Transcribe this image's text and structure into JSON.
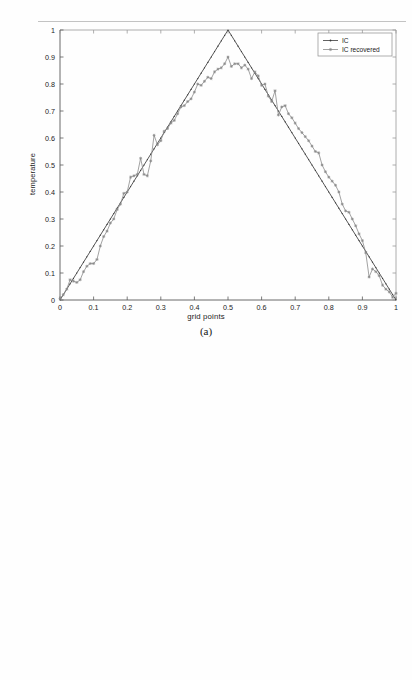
{
  "page": {
    "background": "#fefefe",
    "artifact_line": "scan-artifact-line"
  },
  "figures": [
    {
      "id": "figure-a",
      "caption": "(a)",
      "xlabel": "grid points",
      "ylabel": "temperature",
      "legend": {
        "position": "top-right",
        "entries": [
          {
            "label": "IC",
            "marker": "dot",
            "line": "solid",
            "color": "#3a3a3a"
          },
          {
            "label": "IC recovered",
            "marker": "star",
            "line": "solid",
            "color": "#8a8a8a"
          }
        ]
      }
    },
    {
      "id": "figure-b",
      "caption": "(b)",
      "xlabel": "grid points",
      "ylabel": "temperature",
      "legend": {
        "position": "top-right",
        "entries": [
          {
            "label": "IC",
            "marker": "dot",
            "line": "solid",
            "color": "#3a3a3a"
          },
          {
            "label": "IC recovered",
            "marker": "star",
            "line": "none",
            "color": "#8a8a8a"
          }
        ]
      }
    }
  ],
  "chart_data": [
    {
      "type": "line",
      "id": "figure-a",
      "title": "",
      "xlabel": "grid points",
      "ylabel": "temperature",
      "xlim": [
        0,
        1
      ],
      "ylim": [
        0,
        1
      ],
      "xticks": [
        "0",
        "0.1",
        "0.2",
        "0.3",
        "0.4",
        "0.5",
        "0.6",
        "0.7",
        "0.8",
        "0.9",
        "1"
      ],
      "yticks": [
        "0",
        "0.1",
        "0.2",
        "0.3",
        "0.4",
        "0.5",
        "0.6",
        "0.7",
        "0.8",
        "0.9",
        "1"
      ],
      "grid": false,
      "legend_position": "upper right",
      "series": [
        {
          "name": "IC",
          "style": "solid-line-with-small-dots",
          "color": "#3a3a3a",
          "x": [
            0,
            0.05,
            0.1,
            0.15,
            0.2,
            0.25,
            0.3,
            0.35,
            0.4,
            0.45,
            0.5,
            0.55,
            0.6,
            0.65,
            0.7,
            0.75,
            0.8,
            0.85,
            0.9,
            0.95,
            1
          ],
          "values": [
            0,
            0.1,
            0.2,
            0.3,
            0.4,
            0.5,
            0.6,
            0.7,
            0.8,
            0.9,
            1.0,
            0.9,
            0.8,
            0.7,
            0.6,
            0.5,
            0.4,
            0.3,
            0.2,
            0.1,
            0
          ]
        },
        {
          "name": "IC recovered",
          "style": "noisy-line-with-star-markers",
          "color": "#8a8a8a",
          "x": [
            0.0,
            0.01,
            0.02,
            0.03,
            0.04,
            0.05,
            0.06,
            0.07,
            0.08,
            0.09,
            0.1,
            0.11,
            0.12,
            0.13,
            0.14,
            0.15,
            0.16,
            0.17,
            0.18,
            0.19,
            0.2,
            0.21,
            0.22,
            0.23,
            0.24,
            0.25,
            0.26,
            0.27,
            0.28,
            0.29,
            0.3,
            0.31,
            0.32,
            0.33,
            0.34,
            0.35,
            0.36,
            0.37,
            0.38,
            0.39,
            0.4,
            0.41,
            0.42,
            0.43,
            0.44,
            0.45,
            0.46,
            0.47,
            0.48,
            0.49,
            0.5,
            0.51,
            0.52,
            0.53,
            0.54,
            0.55,
            0.56,
            0.57,
            0.58,
            0.59,
            0.6,
            0.61,
            0.62,
            0.63,
            0.64,
            0.65,
            0.66,
            0.67,
            0.68,
            0.69,
            0.7,
            0.71,
            0.72,
            0.73,
            0.74,
            0.75,
            0.76,
            0.77,
            0.78,
            0.79,
            0.8,
            0.81,
            0.82,
            0.83,
            0.84,
            0.85,
            0.86,
            0.87,
            0.88,
            0.89,
            0.9,
            0.91,
            0.92,
            0.93,
            0.94,
            0.95,
            0.96,
            0.97,
            0.98,
            0.99,
            1.0
          ],
          "values": [
            0.005,
            0.02,
            0.04,
            0.075,
            0.07,
            0.065,
            0.075,
            0.105,
            0.125,
            0.135,
            0.135,
            0.15,
            0.2,
            0.235,
            0.255,
            0.285,
            0.3,
            0.335,
            0.355,
            0.395,
            0.4,
            0.455,
            0.46,
            0.465,
            0.525,
            0.465,
            0.46,
            0.515,
            0.61,
            0.575,
            0.59,
            0.625,
            0.635,
            0.655,
            0.665,
            0.69,
            0.715,
            0.72,
            0.735,
            0.745,
            0.77,
            0.8,
            0.795,
            0.81,
            0.825,
            0.82,
            0.845,
            0.855,
            0.86,
            0.875,
            0.9,
            0.865,
            0.875,
            0.875,
            0.86,
            0.87,
            0.855,
            0.82,
            0.845,
            0.83,
            0.795,
            0.8,
            0.755,
            0.735,
            0.775,
            0.685,
            0.715,
            0.72,
            0.69,
            0.675,
            0.655,
            0.635,
            0.62,
            0.605,
            0.59,
            0.57,
            0.55,
            0.545,
            0.5,
            0.475,
            0.455,
            0.44,
            0.425,
            0.4,
            0.355,
            0.33,
            0.325,
            0.3,
            0.275,
            0.245,
            0.22,
            0.175,
            0.085,
            0.115,
            0.105,
            0.09,
            0.055,
            0.04,
            0.03,
            0.01,
            0.025
          ]
        }
      ]
    },
    {
      "type": "scatter",
      "id": "figure-b",
      "title": "",
      "xlabel": "grid points",
      "ylabel": "temperature",
      "xlim": [
        0,
        1
      ],
      "ylim": [
        0,
        1
      ],
      "xticks": [
        "0",
        "0.1",
        "0.2",
        "0.3",
        "0.4",
        "0.5",
        "0.6",
        "0.7",
        "0.8",
        "0.9",
        "1"
      ],
      "yticks": [
        "0",
        "0.1",
        "0.2",
        "0.3",
        "0.4",
        "0.5",
        "0.6",
        "0.7",
        "0.8",
        "0.9",
        "1"
      ],
      "grid": false,
      "legend_position": "upper right",
      "series": [
        {
          "name": "IC",
          "style": "dotted-triangle",
          "color": "#3a3a3a",
          "x": [
            0,
            0.05,
            0.1,
            0.15,
            0.2,
            0.25,
            0.3,
            0.35,
            0.4,
            0.45,
            0.5,
            0.55,
            0.6,
            0.65,
            0.7,
            0.75,
            0.8,
            0.85,
            0.9,
            0.95,
            1
          ],
          "values": [
            0,
            0.1,
            0.2,
            0.3,
            0.4,
            0.5,
            0.6,
            0.7,
            0.8,
            0.9,
            1.0,
            0.9,
            0.8,
            0.7,
            0.6,
            0.5,
            0.4,
            0.3,
            0.2,
            0.1,
            0
          ]
        },
        {
          "name": "IC recovered",
          "style": "star-markers-smooth",
          "color": "#8a8a8a",
          "x": [
            0.0,
            0.01,
            0.02,
            0.03,
            0.04,
            0.05,
            0.06,
            0.07,
            0.08,
            0.09,
            0.1,
            0.11,
            0.12,
            0.13,
            0.14,
            0.15,
            0.16,
            0.17,
            0.18,
            0.19,
            0.2,
            0.21,
            0.22,
            0.23,
            0.24,
            0.25,
            0.26,
            0.27,
            0.28,
            0.29,
            0.3,
            0.31,
            0.32,
            0.33,
            0.34,
            0.35,
            0.36,
            0.37,
            0.38,
            0.39,
            0.4,
            0.41,
            0.42,
            0.43,
            0.44,
            0.45,
            0.46,
            0.47,
            0.48,
            0.49,
            0.5,
            0.51,
            0.52,
            0.53,
            0.54,
            0.55,
            0.56,
            0.57,
            0.58,
            0.59,
            0.6,
            0.61,
            0.62,
            0.63,
            0.64,
            0.65,
            0.66,
            0.67,
            0.68,
            0.69,
            0.7,
            0.71,
            0.72,
            0.73,
            0.74,
            0.75,
            0.76,
            0.77,
            0.78,
            0.79,
            0.8,
            0.81,
            0.82,
            0.83,
            0.84,
            0.85,
            0.86,
            0.87,
            0.88,
            0.89,
            0.9,
            0.91,
            0.92,
            0.93,
            0.94,
            0.95,
            0.96,
            0.97,
            0.98,
            0.99,
            1.0
          ],
          "values": [
            0.055,
            0.1,
            0.095,
            0.1,
            0.105,
            0.11,
            0.115,
            0.12,
            0.125,
            0.135,
            0.145,
            0.155,
            0.16,
            0.165,
            0.17,
            0.175,
            0.2,
            0.215,
            0.23,
            0.245,
            0.26,
            0.285,
            0.3,
            0.315,
            0.33,
            0.35,
            0.38,
            0.4,
            0.425,
            0.45,
            0.475,
            0.49,
            0.505,
            0.52,
            0.545,
            0.565,
            0.58,
            0.6,
            0.615,
            0.635,
            0.655,
            0.675,
            0.695,
            0.715,
            0.73,
            0.755,
            0.78,
            0.8,
            0.82,
            0.845,
            0.86,
            0.88,
            0.895,
            0.9,
            0.91,
            0.915,
            0.925,
            0.93,
            0.935,
            0.935,
            0.935,
            0.93,
            0.925,
            0.915,
            0.905,
            0.89,
            0.875,
            0.855,
            0.84,
            0.825,
            0.8,
            0.78,
            0.755,
            0.73,
            0.715,
            0.695,
            0.675,
            0.665,
            0.655,
            0.635,
            0.61,
            0.585,
            0.565,
            0.545,
            0.515,
            0.49,
            0.465,
            0.445,
            0.445,
            0.42,
            0.42,
            0.39,
            0.375,
            0.355,
            0.335,
            0.33,
            0.31,
            0.29,
            0.265,
            0.25,
            0.235
          ]
        }
      ]
    }
  ]
}
